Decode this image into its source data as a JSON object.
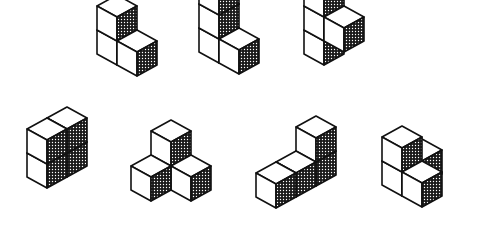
{
  "cube": {
    "dx": 20,
    "dy": 11,
    "h": 24
  },
  "colors": {
    "line": "#111111",
    "shade_dot": "#111111",
    "face": "#ffffff"
  },
  "figures": [
    {
      "name": "figure-1",
      "origin": [
        117,
        41
      ],
      "cubes": [
        [
          0,
          0,
          1
        ],
        [
          0,
          0,
          0
        ],
        [
          1,
          1,
          0
        ]
      ]
    },
    {
      "name": "figure-2",
      "origin": [
        219,
        39
      ],
      "cubes": [
        [
          0,
          0,
          2
        ],
        [
          0,
          0,
          1
        ],
        [
          0,
          0,
          0
        ],
        [
          1,
          1,
          0
        ]
      ]
    },
    {
      "name": "figure-3",
      "origin": [
        324,
        41
      ],
      "cubes": [
        [
          0,
          0,
          2
        ],
        [
          0,
          0,
          1
        ],
        [
          0,
          0,
          0
        ],
        [
          1,
          1,
          1
        ]
      ]
    },
    {
      "name": "figure-4",
      "origin": [
        47,
        164
      ],
      "cubes": [
        [
          1,
          -1,
          1
        ],
        [
          1,
          -1,
          0
        ],
        [
          0,
          0,
          1
        ],
        [
          0,
          0,
          0
        ]
      ]
    },
    {
      "name": "figure-5",
      "origin": [
        171,
        166
      ],
      "cubes": [
        [
          0,
          0,
          1
        ],
        [
          -1,
          1,
          0
        ],
        [
          1,
          1,
          0
        ]
      ]
    },
    {
      "name": "figure-6",
      "origin": [
        296,
        173
      ],
      "cubes": [
        [
          1,
          -1,
          1
        ],
        [
          1,
          -1,
          0
        ],
        [
          0,
          0,
          0
        ],
        [
          -1,
          1,
          0
        ]
      ]
    },
    {
      "name": "figure-7",
      "origin": [
        402,
        172
      ],
      "cubes": [
        [
          1,
          -1,
          0
        ],
        [
          0,
          0,
          1
        ],
        [
          0,
          0,
          0
        ],
        [
          1,
          1,
          0
        ]
      ]
    }
  ]
}
